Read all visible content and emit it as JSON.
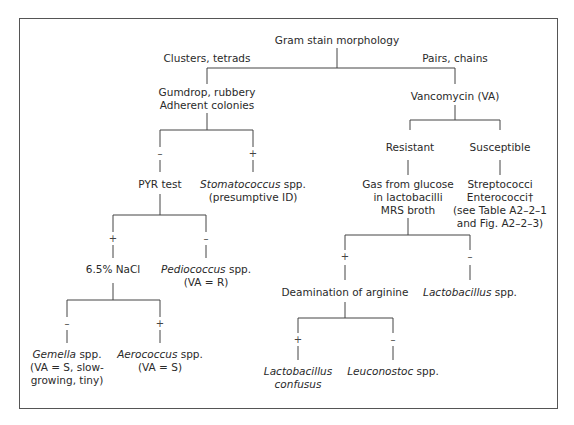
{
  "diagram": {
    "root": "Gram stain morphology",
    "branch_left_label": "Clusters, tetrads",
    "branch_right_label": "Pairs, chains",
    "gumdrop": [
      "Gumdrop, rubbery",
      "Adherent colonies"
    ],
    "vancomycin": "Vancomycin (VA)",
    "resistant": "Resistant",
    "susceptible": "Susceptible",
    "pyr_test": "PYR test",
    "stomatococcus": {
      "genus": "Stomatococcus",
      "suffix": " spp.",
      "note": "(presumptive ID)"
    },
    "nacl": "6.5% NaCl",
    "pediococcus": {
      "genus": "Pediococcus",
      "suffix": " spp.",
      "note": "(VA = R)"
    },
    "gemella": {
      "genus": "Gemella",
      "suffix": " spp.",
      "note1": "(VA = S, slow-",
      "note2": "growing, tiny)"
    },
    "aerococcus": {
      "genus": "Aerococcus",
      "suffix": " spp.",
      "note": "(VA = S)"
    },
    "gas_glucose": [
      "Gas from glucose",
      "in lactobacilli",
      "MRS broth"
    ],
    "strep": [
      "Streptococci",
      "Enterococci†",
      "(see Table A2–2–1",
      "and Fig. A2–2–3)"
    ],
    "deamination": "Deamination of arginine",
    "lactobacillus_spp": {
      "genus": "Lactobacillus",
      "suffix": " spp."
    },
    "lactobacillus_confusus": [
      "Lactobacillus",
      "confusus"
    ],
    "leuconostoc": {
      "genus": "Leuconostoc",
      "suffix": " spp."
    },
    "signs": {
      "plus": "+",
      "minus": "–"
    }
  }
}
